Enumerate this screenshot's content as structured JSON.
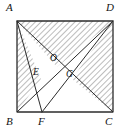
{
  "figure": {
    "stroke_color": "#2b2b2b",
    "hatch_color": "#6b6b6b",
    "label_color": "#141414",
    "background": "#ffffff",
    "rect": {
      "left": 17,
      "top": 21,
      "right": 113,
      "bottom": 112,
      "width": 96,
      "height": 91
    },
    "points": [
      {
        "id": "A",
        "label": "A",
        "x": 17,
        "y": 21,
        "label_x": 6,
        "label_y": 2,
        "role": "rectangle-vertex-top-left"
      },
      {
        "id": "D",
        "label": "D",
        "x": 113,
        "y": 21,
        "label_x": 106,
        "label_y": 2,
        "role": "rectangle-vertex-top-right"
      },
      {
        "id": "B",
        "label": "B",
        "x": 17,
        "y": 112,
        "label_x": 6,
        "label_y": 116,
        "role": "rectangle-vertex-bottom-left"
      },
      {
        "id": "C",
        "label": "C",
        "x": 113,
        "y": 112,
        "label_x": 105,
        "label_y": 116,
        "role": "rectangle-vertex-bottom-right"
      },
      {
        "id": "F",
        "label": "F",
        "x": 42,
        "y": 112,
        "label_x": 38,
        "label_y": 116,
        "role": "point-on-segment-BC"
      },
      {
        "id": "E",
        "label": "E",
        "x": 41,
        "y": 79,
        "label_x": 33,
        "label_y": 68,
        "role": "intersection-AF-BD"
      },
      {
        "id": "O",
        "label": "O",
        "x": 57,
        "y": 67,
        "label_x": 50,
        "label_y": 54,
        "role": "intersection-label-O"
      },
      {
        "id": "G",
        "label": "G",
        "x": 72,
        "y": 79,
        "label_x": 66,
        "label_y": 70,
        "role": "intersection-AC-FD"
      }
    ],
    "segments": [
      {
        "id": "AB",
        "from": "A",
        "to": "B",
        "kind": "rectangle-side"
      },
      {
        "id": "BC",
        "from": "B",
        "to": "C",
        "kind": "rectangle-side"
      },
      {
        "id": "CD",
        "from": "C",
        "to": "D",
        "kind": "rectangle-side"
      },
      {
        "id": "DA",
        "from": "D",
        "to": "A",
        "kind": "rectangle-side"
      },
      {
        "id": "AC",
        "from": "A",
        "to": "C",
        "kind": "diagonal"
      },
      {
        "id": "BD",
        "from": "B",
        "to": "D",
        "kind": "diagonal"
      },
      {
        "id": "AF",
        "from": "A",
        "to": "F",
        "kind": "cevian"
      },
      {
        "id": "FD",
        "from": "F",
        "to": "D",
        "kind": "cevian"
      }
    ],
    "shaded_regions": [
      {
        "id": "region-ABE",
        "vertices": [
          "A",
          "B",
          "E"
        ],
        "fill": "hatch"
      },
      {
        "id": "region-AOD",
        "vertices": [
          "A",
          "O",
          "D"
        ],
        "fill": "hatch"
      },
      {
        "id": "region-GDC",
        "vertices": [
          "G",
          "D",
          "C"
        ],
        "fill": "hatch"
      }
    ],
    "hatch": {
      "angle_deg": 45,
      "spacing_px": 4,
      "line_width_px": 0.9
    }
  }
}
